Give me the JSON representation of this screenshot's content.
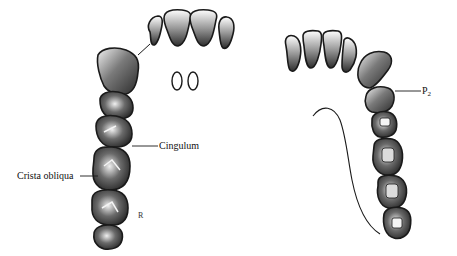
{
  "figure": {
    "colors": {
      "outline": "#1a1a1a",
      "shading": "#3a3a3a",
      "background": "#ffffff",
      "label_text": "#111111"
    },
    "left_arch": {
      "name": "maxillary-arch",
      "labels": [
        {
          "id": "cingulum",
          "text": "Cingulum"
        },
        {
          "id": "crista-obliqua",
          "text": "Crista obliqua"
        }
      ],
      "signature": "R"
    },
    "right_arch": {
      "name": "mandibular-arch",
      "labels": [
        {
          "id": "p2",
          "text": "P",
          "subscript": "2"
        }
      ]
    }
  }
}
